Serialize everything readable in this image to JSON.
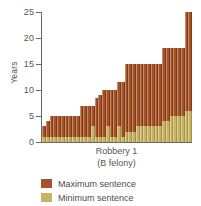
{
  "chart_data": {
    "type": "bar",
    "title": "",
    "xlabel": "Robbery 1",
    "xlabel_sub": "(B felony)",
    "ylabel": "Years",
    "ylim": [
      0,
      25
    ],
    "yticks": [
      0,
      5,
      10,
      15,
      20,
      25
    ],
    "ytick_labels": [
      "0",
      "5",
      "10",
      "15",
      "20",
      "25"
    ],
    "grid": false,
    "legend_position": "bottom-left",
    "stacked": false,
    "overlaid": true,
    "bar_count": 40,
    "categories": [
      "1",
      "2",
      "3",
      "4",
      "5",
      "6",
      "7",
      "8",
      "9",
      "10",
      "11",
      "12",
      "13",
      "14",
      "15",
      "16",
      "17",
      "18",
      "19",
      "20",
      "21",
      "22",
      "23",
      "24",
      "25",
      "26",
      "27",
      "28",
      "29",
      "30",
      "31",
      "32",
      "33",
      "34",
      "35",
      "36",
      "37",
      "38",
      "39",
      "40"
    ],
    "series": [
      {
        "name": "Maximum sentence",
        "color": "#a5512a",
        "values": [
          3,
          4,
          5,
          5,
          5,
          5,
          5,
          5,
          5,
          5,
          7,
          7,
          7,
          7,
          8.5,
          9,
          10,
          10,
          10,
          10,
          11.5,
          11.5,
          15,
          15,
          15,
          15,
          15,
          15,
          15,
          15,
          15,
          15,
          18,
          18,
          18,
          18,
          18,
          18,
          25,
          25
        ]
      },
      {
        "name": "Minimum sentence",
        "color": "#c6b462",
        "values": [
          1,
          1,
          1,
          1,
          1,
          1,
          1,
          1,
          1,
          1,
          1,
          1,
          1,
          3,
          1,
          1,
          1,
          3,
          1,
          1,
          3,
          1,
          2,
          2,
          2,
          3,
          3,
          3,
          3,
          3,
          3,
          3,
          4,
          4,
          5,
          5,
          5,
          5,
          6,
          6
        ]
      }
    ],
    "legend": [
      {
        "label": "Maximum sentence",
        "color": "#a5512a"
      },
      {
        "label": "Minimum sentence",
        "color": "#c6b462"
      }
    ]
  }
}
